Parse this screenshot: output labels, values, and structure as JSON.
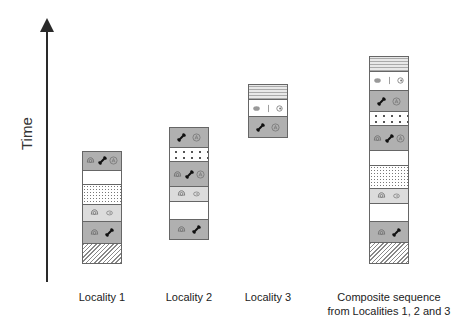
{
  "axis": {
    "label": "Time",
    "direction": "up"
  },
  "colors": {
    "dark_gray": "#b0b0b0",
    "light_gray": "#dcdcdc",
    "white": "#ffffff",
    "outline": "#666666",
    "axis": "#2a2a2a"
  },
  "columns": [
    {
      "id": "locality-1",
      "label": "Locality 1",
      "layers_top_to_bottom": [
        {
          "pattern": "gray",
          "fossils": [
            "ammonite",
            "bone",
            "ammonite-A"
          ]
        },
        {
          "pattern": "white",
          "fossils": []
        },
        {
          "pattern": "dense-dotted",
          "fossils": []
        },
        {
          "pattern": "light",
          "fossils": [
            "ammonite",
            "shell"
          ]
        },
        {
          "pattern": "gray",
          "fossils": [
            "ammonite",
            "bone"
          ]
        },
        {
          "pattern": "hatched",
          "fossils": []
        }
      ]
    },
    {
      "id": "locality-2",
      "label": "Locality 2",
      "layers_top_to_bottom": [
        {
          "pattern": "gray",
          "fossils": [
            "bone",
            "ammonite-A"
          ]
        },
        {
          "pattern": "sparse-dotted",
          "fossils": []
        },
        {
          "pattern": "gray",
          "fossils": [
            "ammonite",
            "bone",
            "ammonite-A"
          ]
        },
        {
          "pattern": "light",
          "fossils": [
            "ammonite",
            "shell"
          ]
        },
        {
          "pattern": "white",
          "fossils": []
        },
        {
          "pattern": "gray",
          "fossils": [
            "ammonite",
            "bone"
          ]
        }
      ]
    },
    {
      "id": "locality-3",
      "label": "Locality 3",
      "layers_top_to_bottom": [
        {
          "pattern": "lined",
          "fossils": []
        },
        {
          "pattern": "white",
          "fossils": [
            "blob",
            "spine",
            "clam"
          ]
        },
        {
          "pattern": "gray",
          "fossils": [
            "bone",
            "ammonite-A"
          ]
        }
      ]
    },
    {
      "id": "composite",
      "label": "Composite sequence",
      "label_line2": "from Localities 1, 2 and 3",
      "layers_top_to_bottom": [
        {
          "pattern": "lined",
          "fossils": []
        },
        {
          "pattern": "white",
          "fossils": [
            "blob",
            "spine",
            "clam"
          ]
        },
        {
          "pattern": "gray",
          "fossils": [
            "bone",
            "ammonite-A"
          ]
        },
        {
          "pattern": "sparse-dotted",
          "fossils": []
        },
        {
          "pattern": "gray",
          "fossils": [
            "ammonite",
            "bone",
            "ammonite-A"
          ]
        },
        {
          "pattern": "white",
          "fossils": []
        },
        {
          "pattern": "dense-dotted",
          "fossils": []
        },
        {
          "pattern": "light",
          "fossils": [
            "ammonite",
            "shell"
          ]
        },
        {
          "pattern": "white",
          "fossils": []
        },
        {
          "pattern": "gray",
          "fossils": [
            "ammonite",
            "bone"
          ]
        },
        {
          "pattern": "hatched",
          "fossils": []
        }
      ]
    }
  ]
}
